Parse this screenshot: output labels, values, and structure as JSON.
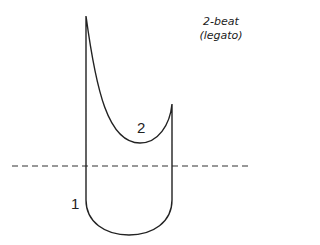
{
  "diagram": {
    "title_line1": "2-beat",
    "title_line2": "(legato)",
    "beat_labels": [
      "1",
      "2"
    ],
    "baseline_style": "dashed",
    "stroke_color": "#222222",
    "background_color": "#ffffff"
  }
}
